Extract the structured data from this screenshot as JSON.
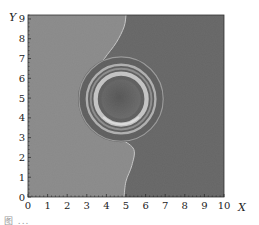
{
  "chart_data": {
    "type": "heatmap",
    "title": "",
    "xlabel": "X",
    "ylabel": "Y",
    "xlim": [
      0,
      10
    ],
    "ylim": [
      0,
      9.2
    ],
    "x_ticks": [
      "0",
      "1",
      "2",
      "3",
      "4",
      "5",
      "6",
      "7",
      "8",
      "9",
      "10"
    ],
    "y_ticks": [
      "0",
      "1",
      "2",
      "3",
      "4",
      "5",
      "6",
      "7",
      "8",
      "9"
    ],
    "grid": false,
    "legend": null,
    "regions": [
      {
        "name": "left-phase",
        "color": "#8a8a8a"
      },
      {
        "name": "right-phase",
        "color": "#666666"
      }
    ],
    "interface_curve": [
      [
        5.0,
        9.2
      ],
      [
        4.9,
        8.6
      ],
      [
        4.5,
        7.8
      ],
      [
        3.9,
        7.0
      ],
      [
        3.4,
        6.2
      ],
      [
        3.3,
        5.0
      ],
      [
        3.5,
        3.9
      ],
      [
        4.1,
        3.3
      ],
      [
        4.8,
        2.9
      ],
      [
        5.4,
        2.4
      ],
      [
        5.3,
        1.6
      ],
      [
        5.0,
        0.8
      ],
      [
        4.9,
        0.0
      ]
    ],
    "rings": {
      "center": [
        4.75,
        4.95
      ],
      "radii": [
        {
          "r": 2.15,
          "color": "#9a9a9a",
          "width": 0.06
        },
        {
          "r": 1.75,
          "color": "#b0b0b0",
          "width": 0.12
        },
        {
          "r": 1.55,
          "color": "#8c8c8c",
          "width": 0.1
        },
        {
          "r": 1.3,
          "color": "#c4c4c4",
          "width": 0.22
        },
        {
          "r": 1.0,
          "color": "#5a5a5a",
          "width": 0.0
        }
      ]
    }
  },
  "figure": {
    "y_axis_label": "Y",
    "x_axis_label": "X",
    "caption": "图 ..."
  }
}
